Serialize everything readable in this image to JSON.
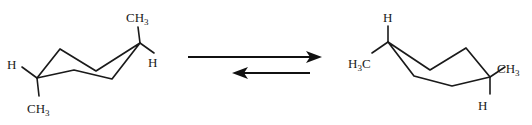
{
  "figure": {
    "width": 532,
    "height": 125,
    "background": "#ffffff",
    "bond_color": "#1a1a1a",
    "arrow_color": "#111111"
  },
  "left_structure": {
    "name": "chair-conformer-left",
    "ring_path": "M 37,78 L 60,49 L 96,71 L 140,43 L 112,79 L 74,70 Z",
    "substituents": [
      {
        "name": "methyl-axial-up-right",
        "label": "CH3",
        "label_text": "CH",
        "label_sub": "3",
        "bond": "M 140,43 L 138,27",
        "label_x": 126,
        "label_y": 22,
        "anchor": "start"
      },
      {
        "name": "hydrogen-equatorial-right",
        "label": "H",
        "label_text": "H",
        "label_sub": "",
        "bond": "M 140,43 L 154,53",
        "label_x": 148,
        "label_y": 67,
        "anchor": "start"
      },
      {
        "name": "methyl-axial-down-left",
        "label": "CH3",
        "label_text": "CH",
        "label_sub": "3",
        "bond": "M 37,78 L 39,96",
        "label_x": 27,
        "label_y": 113,
        "anchor": "start"
      },
      {
        "name": "hydrogen-equatorial-left",
        "label": "H",
        "label_text": "H",
        "label_sub": "",
        "bond": "M 37,78 L 22,67",
        "label_x": 7,
        "label_y": 69,
        "anchor": "start"
      }
    ]
  },
  "right_structure": {
    "name": "chair-conformer-right",
    "ring_path": "M 388,42 L 430,70 L 466,48 L 490,77 L 452,86 L 414,76 Z",
    "substituents": [
      {
        "name": "hydrogen-axial-up-left",
        "label": "H",
        "label_text": "H",
        "label_sub": "",
        "bond": "M 388,42 L 388,26",
        "label_x": 383,
        "label_y": 22,
        "anchor": "start"
      },
      {
        "name": "methyl-equatorial-left",
        "label": "H3C",
        "label_text": "H",
        "label_sub": "3",
        "label_tail": "C",
        "bond": "M 388,42 L 372,53",
        "label_x": 348,
        "label_y": 68,
        "anchor": "start"
      },
      {
        "name": "methyl-equatorial-right",
        "label": "CH3",
        "label_text": "CH",
        "label_sub": "3",
        "bond": "M 490,77 L 505,67",
        "label_x": 497,
        "label_y": 73,
        "anchor": "start"
      },
      {
        "name": "hydrogen-axial-down-right",
        "label": "H",
        "label_text": "H",
        "label_sub": "",
        "bond": "M 490,77 L 490,94",
        "label_x": 478,
        "label_y": 110,
        "anchor": "start"
      }
    ]
  },
  "equilibrium_arrows": {
    "name": "equilibrium-arrows",
    "forward": {
      "name": "forward-arrow",
      "direction": "right",
      "line": "M 188,57 L 318,57",
      "head": "M 322,57 L 306,51 L 310,57 L 306,63 Z"
    },
    "reverse": {
      "name": "reverse-arrow",
      "direction": "left",
      "line": "M 236,73 L 310,73",
      "head": "M 232,73 L 248,67 L 244,73 L 248,79 Z"
    }
  }
}
